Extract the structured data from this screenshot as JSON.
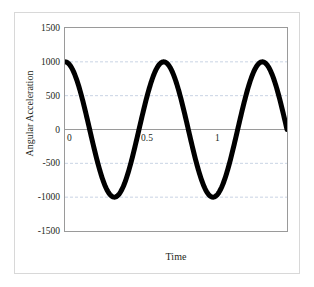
{
  "chart_data": {
    "type": "line",
    "title": "",
    "xlabel": "Time",
    "ylabel": "Angular Acceleration",
    "xlim": [
      0,
      1.5
    ],
    "ylim": [
      -1500,
      1500
    ],
    "xticks": [
      "0",
      "0.5",
      "1",
      "1.5"
    ],
    "xtick_values": [
      0,
      0.5,
      1,
      1.5
    ],
    "yticks": [
      "1500",
      "1000",
      "500",
      "0",
      "-500",
      "-1000",
      "-1500"
    ],
    "ytick_values": [
      1500,
      1000,
      500,
      0,
      -500,
      -1000,
      -1500
    ],
    "grid": true,
    "grid_axis": "y",
    "grid_style": "dashed",
    "legend": false,
    "series": [
      {
        "name": "Angular Acceleration",
        "color": "#000000",
        "line_width": 5,
        "form": "cosine",
        "amplitude": 1000,
        "period": 0.6667,
        "phase": 0,
        "offset": 0,
        "x": [
          0,
          0.0167,
          0.0333,
          0.05,
          0.0667,
          0.0833,
          0.1,
          0.1167,
          0.1333,
          0.15,
          0.1667,
          0.1833,
          0.2,
          0.2167,
          0.2333,
          0.25,
          0.2667,
          0.2833,
          0.3,
          0.3167,
          0.3333,
          0.35,
          0.3667,
          0.3833,
          0.4,
          0.4167,
          0.4333,
          0.45,
          0.4667,
          0.4833,
          0.5,
          0.5167,
          0.5333,
          0.55,
          0.5667,
          0.5833,
          0.6,
          0.6167,
          0.6333,
          0.65,
          0.6667,
          0.6833,
          0.7,
          0.7167,
          0.7333,
          0.75,
          0.7667,
          0.7833,
          0.8,
          0.8167,
          0.8333,
          0.85,
          0.8667,
          0.8833,
          0.9,
          0.9167,
          0.9333,
          0.95,
          0.9667,
          0.9833,
          1,
          1.0167,
          1.0333,
          1.05,
          1.0667,
          1.0833,
          1.1,
          1.1167,
          1.1333,
          1.15,
          1.1667,
          1.1833,
          1.2,
          1.2167,
          1.2333,
          1.25,
          1.2667,
          1.2833,
          1.3,
          1.3167,
          1.3333,
          1.35,
          1.3667,
          1.3833,
          1.4,
          1.4167,
          1.4333,
          1.45,
          1.4667,
          1.4833,
          1.5
        ],
        "y": [
          1000,
          988,
          951,
          891,
          809,
          707,
          588,
          454,
          309,
          156,
          0,
          -156,
          -309,
          -454,
          -588,
          -707,
          -809,
          -891,
          -951,
          -988,
          -1000,
          -988,
          -951,
          -891,
          -809,
          -707,
          -588,
          -454,
          -309,
          -156,
          0,
          156,
          309,
          454,
          588,
          707,
          809,
          891,
          951,
          988,
          1000,
          988,
          951,
          891,
          809,
          707,
          588,
          454,
          309,
          156,
          0,
          -156,
          -309,
          -454,
          -588,
          -707,
          -809,
          -891,
          -951,
          -988,
          -1000,
          -988,
          -951,
          -891,
          -809,
          -707,
          -588,
          -454,
          -309,
          -156,
          0,
          156,
          309,
          454,
          588,
          707,
          809,
          891,
          951,
          988,
          1000,
          988,
          951,
          891,
          809,
          707,
          588,
          454,
          309,
          156,
          0
        ],
        "start_value": 1000,
        "end_value": -650,
        "peaks": [
          {
            "x": 0,
            "y": 1000
          },
          {
            "x": 0.667,
            "y": 1000
          },
          {
            "x": 1.333,
            "y": 1000
          }
        ],
        "troughs": [
          {
            "x": 0.333,
            "y": -1000
          },
          {
            "x": 1.0,
            "y": -1000
          }
        ]
      }
    ],
    "colors": {
      "curve": "#000000",
      "gridline": "#c9d4e4",
      "zero_line": "#9a9a9a",
      "plot_border": "#9a9a9a",
      "outer_border": "#d8d8d8",
      "background": "#ffffff",
      "text": "#231f20"
    }
  },
  "axes": {
    "y_title": "Angular Acceleration",
    "x_title": "Time",
    "y_labels": [
      "1500",
      "1000",
      "500",
      "0",
      "-500",
      "-1000",
      "-1500"
    ],
    "x_labels": [
      "0",
      "0.5",
      "1",
      "1.5"
    ]
  }
}
